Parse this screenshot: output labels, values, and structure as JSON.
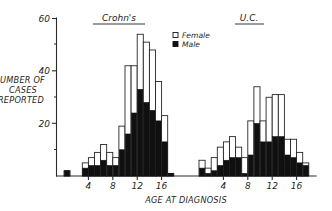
{
  "chart_data": {
    "type": "bar",
    "title": "",
    "xlabel": "AGE AT DIAGNOSIS",
    "ylabel": "NUMBER OF CASES REPORTED",
    "ylabel_lines": [
      "NUMBER OF",
      "CASES",
      "REPORTED"
    ],
    "ylim": [
      0,
      60
    ],
    "y_major_ticks": [
      20,
      40,
      60
    ],
    "y_minor_ticks": [
      10,
      30,
      50
    ],
    "y_tick_labels": [
      "20",
      "40",
      "60"
    ],
    "grid": false,
    "stacked": true,
    "legend": {
      "position": "top-center-right",
      "entries": [
        {
          "name": "Female",
          "swatch": "open-square",
          "color": "#ffffff"
        },
        {
          "name": "Male",
          "swatch": "filled-square",
          "color": "#101010"
        }
      ]
    },
    "panels": [
      {
        "name": "crohns",
        "title": "Crohn's",
        "xlabel": "AGE AT DIAGNOSIS",
        "x_major_ticks": [
          4,
          8,
          12,
          16
        ],
        "x_tick_labels": [
          "4",
          "8",
          "12",
          "16"
        ],
        "xlim": [
          0,
          18
        ],
        "categories": [
          0,
          1,
          2,
          3,
          4,
          5,
          6,
          7,
          8,
          9,
          10,
          11,
          12,
          13,
          14,
          15,
          16,
          17
        ],
        "series": [
          {
            "name": "Male",
            "values": [
              2,
              0,
              0,
              3,
              4,
              4,
              6,
              4,
              4,
              10,
              16,
              24,
              33,
              28,
              25,
              21,
              13,
              1
            ]
          },
          {
            "name": "Female",
            "values": [
              0,
              0,
              0,
              2,
              3,
              5,
              6,
              5,
              3,
              9,
              26,
              18,
              21,
              23,
              23,
              15,
              10,
              0
            ]
          }
        ],
        "totals": [
          2,
          0,
          0,
          5,
          7,
          9,
          12,
          9,
          7,
          19,
          42,
          42,
          54,
          51,
          48,
          36,
          23,
          1
        ]
      },
      {
        "name": "uc",
        "title": "U.C.",
        "xlabel": "AGE AT DIAGNOSIS",
        "x_major_ticks": [
          4,
          8,
          12,
          16
        ],
        "x_tick_labels": [
          "4",
          "8",
          "12",
          "16"
        ],
        "xlim": [
          0,
          18
        ],
        "categories": [
          0,
          1,
          2,
          3,
          4,
          5,
          6,
          7,
          8,
          9,
          10,
          11,
          12,
          13,
          14,
          15,
          16,
          17
        ],
        "series": [
          {
            "name": "Male",
            "values": [
              3,
              1,
              2,
              4,
              6,
              7,
              7,
              1,
              8,
              20,
              13,
              13,
              15,
              15,
              8,
              7,
              5,
              4
            ]
          },
          {
            "name": "Female",
            "values": [
              3,
              2,
              5,
              7,
              7,
              8,
              4,
              6,
              13,
              14,
              8,
              17,
              16,
              16,
              6,
              7,
              4,
              1
            ]
          }
        ],
        "totals": [
          6,
          3,
          7,
          11,
          13,
          15,
          11,
          7,
          21,
          34,
          21,
          30,
          31,
          31,
          14,
          14,
          9,
          5
        ]
      }
    ]
  }
}
